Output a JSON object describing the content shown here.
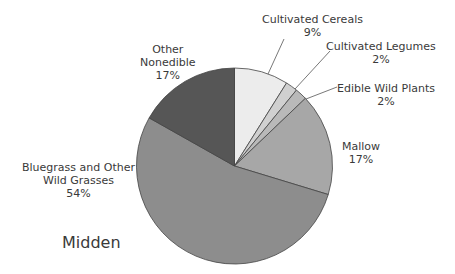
{
  "chart_data": {
    "type": "pie",
    "title": "Midden",
    "start_angle_deg": 0,
    "direction": "clockwise",
    "slices": [
      {
        "label": "Cultivated Cereals",
        "value": 9,
        "display": "9%",
        "color": "#ececec"
      },
      {
        "label": "Cultivated Legumes",
        "value": 2,
        "display": "2%",
        "color": "#d0d0d0"
      },
      {
        "label": "Edible Wild Plants",
        "value": 2,
        "display": "2%",
        "color": "#b9b9b9"
      },
      {
        "label": "Mallow",
        "value": 17,
        "display": "17%",
        "color": "#a7a7a7"
      },
      {
        "label": "Bluegrass and Other Wild Grasses",
        "value": 54,
        "display": "54%",
        "color": "#8d8d8d"
      },
      {
        "label": "Other Nonedible",
        "value": 17,
        "display": "17%",
        "color": "#565656"
      }
    ]
  },
  "labels": {
    "cereals": {
      "line1": "Cultivated Cereals",
      "pct": "9%"
    },
    "legumes": {
      "line1": "Cultivated Legumes",
      "pct": "2%"
    },
    "edible": {
      "line1": "Edible Wild Plants",
      "pct": "2%"
    },
    "mallow": {
      "line1": "Mallow",
      "pct": "17%"
    },
    "bluegrass": {
      "line1": "Bluegrass and Other",
      "line2": "Wild Grasses",
      "pct": "54%"
    },
    "other": {
      "line1": "Other",
      "line2": "Nonedible",
      "pct": "17%"
    }
  },
  "title": "Midden"
}
